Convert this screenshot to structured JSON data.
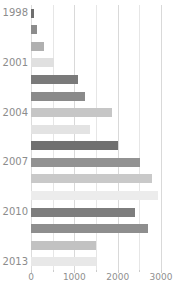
{
  "chart_data": {
    "type": "bar",
    "orientation": "horizontal",
    "title": "",
    "subtitle": "",
    "xlabel": "",
    "ylabel": "",
    "xlim": [
      0,
      3000
    ],
    "ylim": [
      1997.5,
      2013.5
    ],
    "grid": true,
    "legend": null,
    "xticks": [
      0,
      1000,
      2000,
      3000
    ],
    "xtick_labels": [
      "0",
      "1000",
      "2000",
      "3000"
    ],
    "minor_xticks": [
      500,
      1500,
      2500
    ],
    "yticks": [
      1998,
      2001,
      2004,
      2007,
      2010,
      2013
    ],
    "ytick_labels": [
      "1998",
      "2001",
      "2004",
      "2007",
      "2010",
      "2013"
    ],
    "categories": [
      "1998",
      "1999",
      "2000",
      "2001",
      "2002",
      "2003",
      "2004",
      "2005",
      "2006",
      "2007",
      "2008",
      "2009",
      "2010",
      "2011",
      "2012",
      "2013"
    ],
    "values": [
      60,
      130,
      290,
      530,
      1090,
      1250,
      1880,
      1360,
      2010,
      2520,
      2790,
      2940,
      2400,
      2690,
      1500,
      1490
    ],
    "bar_colors": [
      "#6e6e6e",
      "#8c8c8c",
      "#b0b0b0",
      "#e0e0e0",
      "#7a7a7a",
      "#8a8a8a",
      "#c6c6c6",
      "#e3e3e3",
      "#707070",
      "#929292",
      "#c9c9c9",
      "#ececec",
      "#7d7d7d",
      "#8e8e8e",
      "#c2c2c2",
      "#e8e8e8"
    ]
  },
  "colors": {
    "background": "#ffffff",
    "gridline_major": "#d9d9d9",
    "gridline_minor": "#e6e6e6",
    "axis": "#dcdcdc",
    "tick_text": "#8f8f8f",
    "label_text": "#8c8c8c"
  }
}
